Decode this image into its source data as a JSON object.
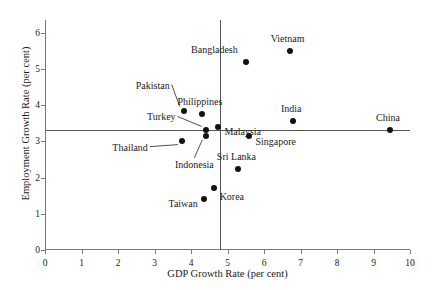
{
  "chart_data": {
    "type": "scatter",
    "title": "",
    "xlabel": "GDP Growth Rate (per cent)",
    "ylabel": "Employment Growth Rate (per cent)",
    "xlim": [
      0,
      10
    ],
    "ylim": [
      0,
      6.35
    ],
    "xticks": [
      0,
      1,
      2,
      3,
      4,
      5,
      6,
      7,
      8,
      9,
      10
    ],
    "yticks": [
      0,
      1,
      2,
      3,
      4,
      5,
      6
    ],
    "xtick_labels": [
      "0",
      "1",
      "2",
      "3",
      "4",
      "5",
      "6",
      "7",
      "8",
      "9",
      "10"
    ],
    "ytick_labels": [
      "0",
      "1",
      "2",
      "3",
      "4",
      "5",
      "6"
    ],
    "grid": false,
    "legend": "none",
    "reference_lines": [
      {
        "name": "mean-employment-growth",
        "orientation": "horizontal",
        "value": 3.3
      },
      {
        "name": "mean-gdp-growth",
        "orientation": "vertical",
        "value": 4.8
      }
    ],
    "point_color": "#111111",
    "axis_color": "#7a7a7a",
    "points": [
      {
        "label": "Vietnam",
        "x": 6.7,
        "y": 5.5,
        "label_dx": -2,
        "label_dy": -13,
        "anchor": "middle",
        "leader": false
      },
      {
        "label": "Bangladesh",
        "x": 5.5,
        "y": 5.2,
        "label_dx": -8,
        "label_dy": -13,
        "anchor": "end",
        "leader": false
      },
      {
        "label": "Pakistan",
        "x": 3.8,
        "y": 3.85,
        "label_dx": -14,
        "label_dy": -26,
        "anchor": "end",
        "leader": true
      },
      {
        "label": "Philippines",
        "x": 4.3,
        "y": 3.75,
        "label_dx": -2,
        "label_dy": -13,
        "anchor": "middle",
        "leader": false
      },
      {
        "label": "India",
        "x": 6.8,
        "y": 3.55,
        "label_dx": -2,
        "label_dy": -13,
        "anchor": "middle",
        "leader": false
      },
      {
        "label": "Malaysia",
        "x": 4.75,
        "y": 3.4,
        "label_dx": 6,
        "label_dy": 4,
        "anchor": "start",
        "leader": false
      },
      {
        "label": "Turkey",
        "x": 4.4,
        "y": 3.3,
        "label_dx": -30,
        "label_dy": -14,
        "anchor": "end",
        "leader": true
      },
      {
        "label": "China",
        "x": 9.45,
        "y": 3.3,
        "label_dx": -2,
        "label_dy": -13,
        "anchor": "middle",
        "leader": false
      },
      {
        "label": "Singapore",
        "x": 5.6,
        "y": 3.15,
        "label_dx": 6,
        "label_dy": 5,
        "anchor": "start",
        "leader": false
      },
      {
        "label": "Indonesia",
        "x": 4.42,
        "y": 3.15,
        "label_dx": -12,
        "label_dy": 28,
        "anchor": "middle",
        "leader": true
      },
      {
        "label": "Thailand",
        "x": 3.75,
        "y": 3.02,
        "label_dx": -34,
        "label_dy": 6,
        "anchor": "end",
        "leader": true
      },
      {
        "label": "Sri Lanka",
        "x": 5.3,
        "y": 2.25,
        "label_dx": -2,
        "label_dy": -13,
        "anchor": "middle",
        "leader": false
      },
      {
        "label": "Korea",
        "x": 4.62,
        "y": 1.7,
        "label_dx": 6,
        "label_dy": 8,
        "anchor": "start",
        "leader": false
      },
      {
        "label": "Taiwan",
        "x": 4.35,
        "y": 1.42,
        "label_dx": -6,
        "label_dy": 4,
        "anchor": "end",
        "leader": false
      }
    ]
  }
}
